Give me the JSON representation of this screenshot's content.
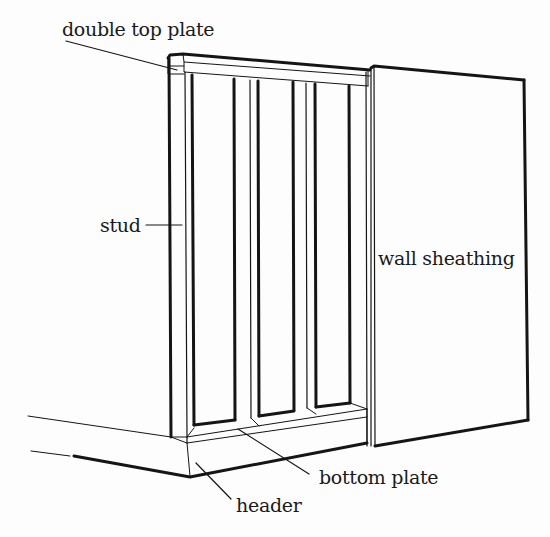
{
  "diagram": {
    "type": "wall framing illustration",
    "labels": {
      "double_top_plate": "double top plate",
      "stud": "stud",
      "wall_sheathing": "wall sheathing",
      "bottom_plate": "bottom plate",
      "header": "header"
    },
    "colors": {
      "line": "#151515",
      "background": "#fdfdfd"
    }
  }
}
